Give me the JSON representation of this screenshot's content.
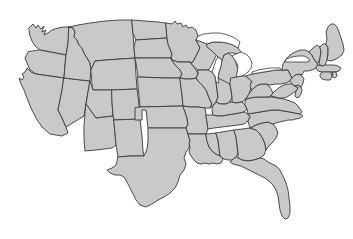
{
  "figure": {
    "kind": "map",
    "title": "",
    "subtitle": "",
    "caption": "",
    "has_text_labels": false,
    "has_legend": false,
    "has_title": false,
    "has_scale_bar": false,
    "has_compass": false,
    "width_px": 353,
    "height_px": 239
  },
  "style": {
    "background_color": "#ffffff",
    "land_fill_color": "#c9c9c9",
    "border_color": "#3a3a3a",
    "border_width_px": 0.9,
    "water_fill_color": "#ffffff",
    "projection_look": "albers-usa"
  },
  "map": {
    "name": "united-states-outline-map",
    "region_count": 49,
    "water_bodies": [
      {
        "name": "lake-michigan",
        "label": ""
      },
      {
        "name": "lake-superior",
        "label": ""
      },
      {
        "name": "lake-huron",
        "label": ""
      },
      {
        "name": "lake-erie",
        "label": ""
      },
      {
        "name": "lake-ontario",
        "label": ""
      }
    ],
    "regions": [
      {
        "code": "WA",
        "label": ""
      },
      {
        "code": "OR",
        "label": ""
      },
      {
        "code": "CA",
        "label": ""
      },
      {
        "code": "NV",
        "label": ""
      },
      {
        "code": "ID",
        "label": ""
      },
      {
        "code": "MT",
        "label": ""
      },
      {
        "code": "WY",
        "label": ""
      },
      {
        "code": "UT",
        "label": ""
      },
      {
        "code": "AZ",
        "label": ""
      },
      {
        "code": "CO",
        "label": ""
      },
      {
        "code": "NM",
        "label": ""
      },
      {
        "code": "ND",
        "label": ""
      },
      {
        "code": "SD",
        "label": ""
      },
      {
        "code": "NE",
        "label": ""
      },
      {
        "code": "KS",
        "label": ""
      },
      {
        "code": "OK",
        "label": ""
      },
      {
        "code": "TX",
        "label": ""
      },
      {
        "code": "MN",
        "label": ""
      },
      {
        "code": "IA",
        "label": ""
      },
      {
        "code": "MO",
        "label": ""
      },
      {
        "code": "AR",
        "label": ""
      },
      {
        "code": "LA",
        "label": ""
      },
      {
        "code": "WI",
        "label": ""
      },
      {
        "code": "IL",
        "label": ""
      },
      {
        "code": "MS",
        "label": ""
      },
      {
        "code": "MI",
        "label": ""
      },
      {
        "code": "IN",
        "label": ""
      },
      {
        "code": "KY",
        "label": ""
      },
      {
        "code": "TN",
        "label": ""
      },
      {
        "code": "AL",
        "label": ""
      },
      {
        "code": "OH",
        "label": ""
      },
      {
        "code": "WV",
        "label": ""
      },
      {
        "code": "VA",
        "label": ""
      },
      {
        "code": "NC",
        "label": ""
      },
      {
        "code": "SC",
        "label": ""
      },
      {
        "code": "GA",
        "label": ""
      },
      {
        "code": "FL",
        "label": ""
      },
      {
        "code": "PA",
        "label": ""
      },
      {
        "code": "NY",
        "label": ""
      },
      {
        "code": "VT",
        "label": ""
      },
      {
        "code": "NH",
        "label": ""
      },
      {
        "code": "ME",
        "label": ""
      },
      {
        "code": "MA",
        "label": ""
      },
      {
        "code": "RI",
        "label": ""
      },
      {
        "code": "CT",
        "label": ""
      },
      {
        "code": "NJ",
        "label": ""
      },
      {
        "code": "DE",
        "label": ""
      },
      {
        "code": "MD",
        "label": ""
      },
      {
        "code": "DC",
        "label": ""
      }
    ]
  }
}
